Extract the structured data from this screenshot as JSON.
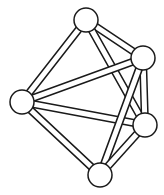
{
  "diagram": {
    "type": "graph",
    "style": {
      "background": "#ffffff",
      "stroke": "#1a1a1a",
      "fill": "#ffffff",
      "node_radius": 12,
      "rod_width": 6
    },
    "nodes": [
      {
        "id": "top",
        "x": 86,
        "y": 20
      },
      {
        "id": "upper-right",
        "x": 143,
        "y": 58
      },
      {
        "id": "left",
        "x": 22,
        "y": 102
      },
      {
        "id": "right",
        "x": 145,
        "y": 125
      },
      {
        "id": "bottom",
        "x": 100,
        "y": 175
      }
    ],
    "edges": [
      [
        "top",
        "left"
      ],
      [
        "top",
        "upper-right"
      ],
      [
        "top",
        "right"
      ],
      [
        "left",
        "upper-right"
      ],
      [
        "left",
        "right"
      ],
      [
        "left",
        "bottom"
      ],
      [
        "upper-right",
        "right"
      ],
      [
        "upper-right",
        "bottom"
      ],
      [
        "right",
        "bottom"
      ]
    ]
  }
}
